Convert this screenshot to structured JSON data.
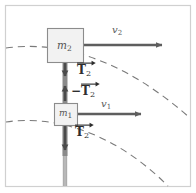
{
  "figure": {
    "frame": {
      "border_color": "#d0d0d0",
      "background": "#ffffff"
    },
    "colors": {
      "box_fill": "#f2f2f2",
      "box_stroke": "#8c8c8c",
      "arrow": "#5e5e5e",
      "rod": "#6e6e6e",
      "dashed_arc": "#7a7a7a",
      "text": "#3b3b3b",
      "label_muted": "#5a5a5a"
    },
    "blocks": [
      {
        "name": "block-m2",
        "label": "m",
        "subscript": "2",
        "x": 47,
        "y": 28,
        "width": 36,
        "height": 34
      },
      {
        "name": "block-m1",
        "label": "m",
        "subscript": "1",
        "x": 54,
        "y": 103,
        "width": 23,
        "height": 22
      }
    ],
    "velocity_vectors": [
      {
        "name": "velocity-v2",
        "label": "v",
        "subscript": "2",
        "label_x": 112,
        "label_y": 25,
        "from_x": 84,
        "from_y": 45,
        "to_x": 168,
        "to_y": 45
      },
      {
        "name": "velocity-v1",
        "label": "v",
        "subscript": "1",
        "label_x": 101,
        "label_y": 99,
        "from_x": 78,
        "from_y": 114,
        "to_x": 147,
        "to_y": 114
      }
    ],
    "force_vectors": [
      {
        "name": "tension-t2-upper",
        "sign": "",
        "symbol": "T",
        "subscript": "2",
        "label_x": 77,
        "label_y": 64,
        "from_x": 65,
        "from_y": 62,
        "to_x": 65,
        "to_y": 80,
        "direction": "down"
      },
      {
        "name": "tension-minus-t2",
        "sign": "−",
        "symbol": "T",
        "subscript": "2",
        "label_x": 72,
        "label_y": 85,
        "from_x": 65,
        "from_y": 100,
        "to_x": 65,
        "to_y": 82,
        "direction": "up"
      },
      {
        "name": "tension-t2-lower",
        "sign": "",
        "symbol": "T",
        "subscript": "2",
        "label_x": 75,
        "label_y": 126,
        "from_x": 65,
        "from_y": 125,
        "to_x": 65,
        "to_y": 154,
        "direction": "down"
      }
    ],
    "rod": {
      "name": "connecting-rod",
      "x": 63,
      "top": 62,
      "bottom": 186,
      "width": 4
    },
    "dashed_arcs": [
      {
        "name": "trajectory-arc-upper",
        "path": "M 6 48 C 56 41, 120 56, 190 118"
      },
      {
        "name": "trajectory-arc-lower",
        "path": "M 6 122 C 46 116, 108 126, 168 186"
      }
    ]
  }
}
